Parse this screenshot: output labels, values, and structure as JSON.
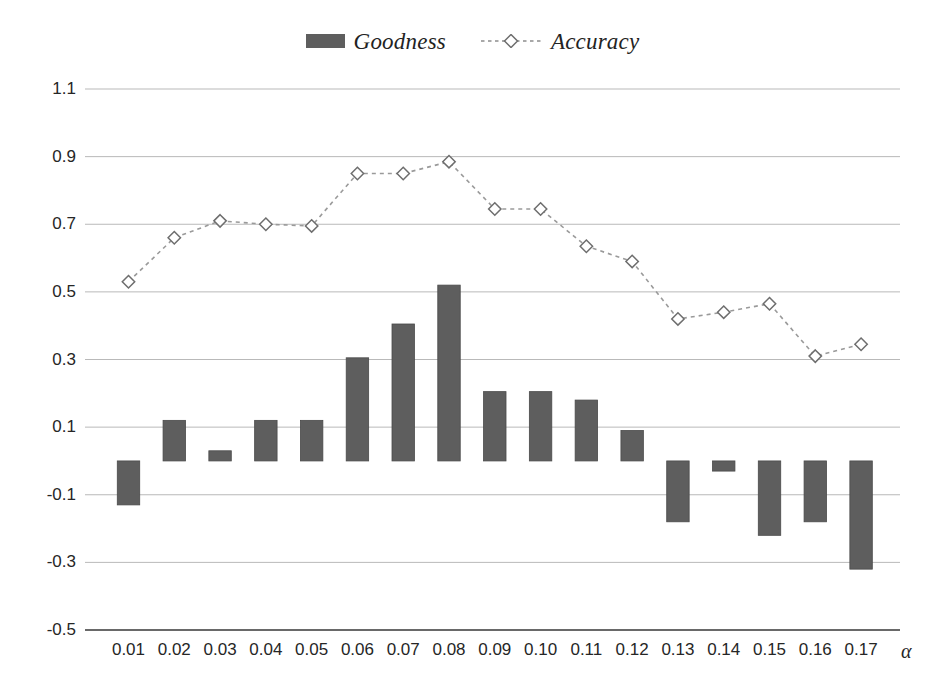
{
  "legend": {
    "position": "top-center",
    "entries": [
      {
        "label": "Goodness",
        "marker": "filled-bar-swatch",
        "color": "#5e5e5e"
      },
      {
        "label": "Accuracy",
        "marker": "dashed-line-diamond",
        "color": "#8a8a8a"
      }
    ]
  },
  "colors": {
    "bar_fill": "#5e5e5e",
    "bar_stroke": "#4a4a4a",
    "line_stroke": "#9a9a9a",
    "marker_stroke": "#6e6e6e",
    "marker_fill": "#ffffff",
    "grid": "#b9b9b9",
    "axis": "#5f5f5f",
    "text": "#262626"
  },
  "chart_data": {
    "type": "bar",
    "title": "",
    "xlabel": "α",
    "ylabel": "",
    "grid": true,
    "legend_position": "top-center",
    "ylim": [
      -0.5,
      1.1
    ],
    "ytick_labels": [
      "1.1",
      "0.9",
      "0.7",
      "0.5",
      "0.3",
      "0.1",
      "-0.1",
      "-0.3",
      "-0.5"
    ],
    "yticks": [
      1.1,
      0.9,
      0.7,
      0.5,
      0.3,
      0.1,
      -0.1,
      -0.3,
      -0.5
    ],
    "categories": [
      "0.01",
      "0.02",
      "0.03",
      "0.04",
      "0.05",
      "0.06",
      "0.07",
      "0.08",
      "0.09",
      "0.10",
      "0.11",
      "0.12",
      "0.13",
      "0.14",
      "0.15",
      "0.16",
      "0.17"
    ],
    "series": [
      {
        "name": "Goodness",
        "kind": "bar",
        "values": [
          -0.13,
          0.12,
          0.03,
          0.12,
          0.12,
          0.305,
          0.405,
          0.52,
          0.205,
          0.205,
          0.18,
          0.09,
          -0.18,
          -0.03,
          -0.22,
          -0.18,
          -0.32
        ]
      },
      {
        "name": "Accuracy",
        "kind": "line",
        "values": [
          0.53,
          0.66,
          0.71,
          0.7,
          0.695,
          0.85,
          0.85,
          0.885,
          0.745,
          0.745,
          0.635,
          0.59,
          0.42,
          0.44,
          0.465,
          0.31,
          0.345
        ]
      }
    ]
  }
}
